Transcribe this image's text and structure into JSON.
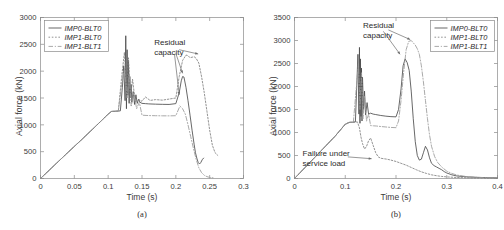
{
  "figure": {
    "panels": [
      {
        "caption": "(a)",
        "xlabel": "Time (s)",
        "ylabel": "Axial force (kN)",
        "legend_position": "top-left",
        "annotations": [
          {
            "name": "residual-capacity",
            "line1": "Residual",
            "line2": "capacity"
          }
        ]
      },
      {
        "caption": "(b)",
        "xlabel": "Time (s)",
        "ylabel": "Axial force (kN)",
        "legend_position": "top-right",
        "annotations": [
          {
            "name": "residual-capacity",
            "line1": "Residual",
            "line2": "capacity"
          },
          {
            "name": "failure-under-service-load",
            "line1": "Failure under",
            "line2": "service load"
          }
        ]
      }
    ]
  },
  "chart_data": [
    {
      "type": "line",
      "panel": "(a)",
      "title": "",
      "xlabel": "Time (s)",
      "ylabel": "Axial force (kN)",
      "xlim": [
        0,
        0.3
      ],
      "ylim": [
        0,
        3000
      ],
      "xticks": [
        0,
        0.05,
        0.1,
        0.15,
        0.2,
        0.25,
        0.3
      ],
      "xticklabels": [
        "0",
        "0.05",
        "0.1",
        "0.15",
        "0.2",
        "0.25",
        "0.3"
      ],
      "yticks": [
        0,
        500,
        1000,
        1500,
        2000,
        2500,
        3000
      ],
      "yticklabels": [
        "0",
        "500",
        "1000",
        "1500",
        "2000",
        "2500",
        "3000"
      ],
      "grid": false,
      "legend": [
        "IMP0-BLT0",
        "IMP1-BLT0",
        "IMP1-BLT1"
      ],
      "legend_position": "upper left",
      "annotations": [
        {
          "text": "Residual capacity",
          "x": 0.168,
          "y": 2480
        }
      ],
      "series": [
        {
          "name": "IMP0-BLT0",
          "style": "solid",
          "color": "#4d4d4d",
          "x": [
            0,
            0.02,
            0.04,
            0.06,
            0.08,
            0.1,
            0.105,
            0.112,
            0.118,
            0.121,
            0.123,
            0.125,
            0.126,
            0.127,
            0.128,
            0.129,
            0.13,
            0.131,
            0.132,
            0.133,
            0.134,
            0.135,
            0.137,
            0.139,
            0.141,
            0.143,
            0.145,
            0.147,
            0.15,
            0.155,
            0.16,
            0.17,
            0.18,
            0.19,
            0.2,
            0.205,
            0.208,
            0.21,
            0.212,
            0.215,
            0.218,
            0.221,
            0.224,
            0.227,
            0.229,
            0.231,
            0.233,
            0.235,
            0.237,
            0.239,
            0.241
          ],
          "y": [
            0,
            240,
            480,
            715,
            955,
            1200,
            1250,
            1255,
            1260,
            1700,
            2100,
            1450,
            2660,
            1300,
            2400,
            1550,
            2200,
            1400,
            1900,
            1500,
            1750,
            1420,
            1620,
            1380,
            1560,
            1400,
            1480,
            1420,
            1400,
            1395,
            1390,
            1385,
            1382,
            1380,
            1395,
            1600,
            1820,
            1900,
            1890,
            1700,
            1450,
            1180,
            900,
            640,
            480,
            380,
            300,
            270,
            300,
            350,
            380
          ]
        },
        {
          "name": "IMP1-BLT0",
          "style": "dotted",
          "color": "#808080",
          "x": [
            0,
            0.02,
            0.04,
            0.06,
            0.08,
            0.1,
            0.105,
            0.115,
            0.12,
            0.124,
            0.127,
            0.13,
            0.133,
            0.136,
            0.14,
            0.145,
            0.15,
            0.155,
            0.162,
            0.17,
            0.18,
            0.19,
            0.2,
            0.205,
            0.21,
            0.215,
            0.218,
            0.221,
            0.224,
            0.227,
            0.23,
            0.234,
            0.238,
            0.242,
            0.246,
            0.25,
            0.254,
            0.258,
            0.262
          ],
          "y": [
            0,
            240,
            480,
            715,
            955,
            1200,
            1250,
            1255,
            1900,
            2350,
            1700,
            2250,
            1500,
            1850,
            1430,
            1470,
            1440,
            1520,
            1455,
            1470,
            1460,
            1480,
            1500,
            1900,
            2200,
            2300,
            2290,
            2250,
            2260,
            2270,
            2240,
            2150,
            1900,
            1600,
            1250,
            900,
            620,
            480,
            430
          ]
        },
        {
          "name": "IMP1-BLT1",
          "style": "dashdot",
          "color": "#9a9a9a",
          "x": [
            0,
            0.02,
            0.04,
            0.06,
            0.08,
            0.1,
            0.105,
            0.115,
            0.12,
            0.124,
            0.128,
            0.131,
            0.134,
            0.138,
            0.142,
            0.146,
            0.15,
            0.156,
            0.162,
            0.17,
            0.18,
            0.19,
            0.2,
            0.206,
            0.21,
            0.214,
            0.218,
            0.222,
            0.226,
            0.23,
            0.234,
            0.238,
            0.242,
            0.246,
            0.25,
            0.255
          ],
          "y": [
            0,
            240,
            480,
            715,
            955,
            1200,
            1250,
            1255,
            1750,
            2050,
            1500,
            1950,
            1350,
            1600,
            1300,
            1420,
            1180,
            1175,
            1172,
            1170,
            1168,
            1167,
            1170,
            1350,
            1300,
            1200,
            1000,
            780,
            560,
            360,
            200,
            110,
            60,
            35,
            20,
            12
          ]
        }
      ]
    },
    {
      "type": "line",
      "panel": "(b)",
      "title": "",
      "xlabel": "Time (s)",
      "ylabel": "Axial force (kN)",
      "xlim": [
        0,
        0.4
      ],
      "ylim": [
        0,
        3500
      ],
      "xticks": [
        0,
        0.1,
        0.2,
        0.3,
        0.4
      ],
      "xticklabels": [
        "0",
        "0.1",
        "0.2",
        "0.3",
        "0.4"
      ],
      "yticks": [
        0,
        500,
        1000,
        1500,
        2000,
        2500,
        3000,
        3500
      ],
      "yticklabels": [
        "0",
        "500",
        "1000",
        "1500",
        "2000",
        "2500",
        "3000",
        "3500"
      ],
      "grid": false,
      "legend": [
        "IMP0-BLT0",
        "IMP1-BLT0",
        "IMP1-BLT1"
      ],
      "legend_position": "upper right",
      "annotations": [
        {
          "text": "Residual capacity",
          "x": 0.135,
          "y": 3280
        },
        {
          "text": "Failure under service load",
          "x": 0.016,
          "y": 480
        }
      ],
      "series": [
        {
          "name": "IMP0-BLT0",
          "style": "solid",
          "color": "#4d4d4d",
          "x": [
            0,
            0.02,
            0.04,
            0.06,
            0.08,
            0.1,
            0.108,
            0.115,
            0.12,
            0.123,
            0.125,
            0.127,
            0.128,
            0.129,
            0.13,
            0.131,
            0.132,
            0.133,
            0.134,
            0.136,
            0.138,
            0.14,
            0.143,
            0.146,
            0.15,
            0.155,
            0.16,
            0.17,
            0.18,
            0.19,
            0.2,
            0.205,
            0.21,
            0.214,
            0.218,
            0.222,
            0.226,
            0.23,
            0.234,
            0.238,
            0.242,
            0.246,
            0.25,
            0.254,
            0.258,
            0.262,
            0.266,
            0.27,
            0.275,
            0.28,
            0.285,
            0.29,
            0.295,
            0.3,
            0.31,
            0.32,
            0.34,
            0.36,
            0.38,
            0.4
          ],
          "y": [
            0,
            230,
            460,
            690,
            920,
            1180,
            1220,
            1225,
            1230,
            2100,
            2700,
            1400,
            2850,
            1200,
            2600,
            1350,
            2400,
            1250,
            2200,
            1500,
            1900,
            1380,
            1650,
            1400,
            1420,
            1400,
            1390,
            1370,
            1355,
            1345,
            1340,
            1500,
            1950,
            2450,
            2600,
            2520,
            2350,
            1900,
            1300,
            800,
            500,
            400,
            420,
            560,
            700,
            620,
            450,
            330,
            280,
            250,
            220,
            190,
            150,
            120,
            80,
            55,
            35,
            25,
            18,
            14
          ]
        },
        {
          "name": "IMP1-BLT0",
          "style": "dotted",
          "color": "#808080",
          "x": [
            0,
            0.02,
            0.04,
            0.06,
            0.08,
            0.1,
            0.108,
            0.118,
            0.124,
            0.128,
            0.131,
            0.134,
            0.138,
            0.142,
            0.146,
            0.15,
            0.155,
            0.16,
            0.165,
            0.17,
            0.176,
            0.182,
            0.19,
            0.2,
            0.21,
            0.22,
            0.23,
            0.24,
            0.25,
            0.26,
            0.27,
            0.28,
            0.29,
            0.3,
            0.32,
            0.34,
            0.36,
            0.38,
            0.4
          ],
          "y": [
            0,
            230,
            460,
            690,
            920,
            1180,
            1220,
            1225,
            1230,
            1100,
            900,
            760,
            640,
            700,
            820,
            880,
            720,
            560,
            470,
            440,
            430,
            420,
            400,
            370,
            330,
            290,
            240,
            190,
            145,
            110,
            80,
            60,
            45,
            35,
            22,
            15,
            10,
            8,
            6
          ]
        },
        {
          "name": "IMP1-BLT1",
          "style": "dashdot",
          "color": "#9a9a9a",
          "x": [
            0,
            0.02,
            0.04,
            0.06,
            0.08,
            0.1,
            0.108,
            0.116,
            0.122,
            0.126,
            0.129,
            0.132,
            0.135,
            0.138,
            0.142,
            0.146,
            0.15,
            0.156,
            0.162,
            0.17,
            0.18,
            0.19,
            0.2,
            0.205,
            0.21,
            0.215,
            0.22,
            0.225,
            0.23,
            0.234,
            0.238,
            0.242,
            0.246,
            0.25,
            0.254,
            0.258,
            0.262,
            0.266,
            0.27,
            0.276,
            0.282,
            0.29,
            0.3,
            0.31,
            0.32,
            0.34,
            0.36,
            0.38,
            0.4
          ],
          "y": [
            0,
            230,
            460,
            690,
            920,
            1180,
            1220,
            1225,
            2000,
            2500,
            1500,
            2300,
            1300,
            1800,
            1250,
            1400,
            1150,
            1145,
            1140,
            1130,
            1120,
            1110,
            1105,
            1250,
            1700,
            2300,
            2800,
            2980,
            3000,
            2950,
            2900,
            2820,
            2700,
            2450,
            2100,
            1700,
            1300,
            950,
            700,
            480,
            350,
            250,
            160,
            110,
            75,
            40,
            25,
            16,
            10
          ]
        }
      ]
    }
  ]
}
